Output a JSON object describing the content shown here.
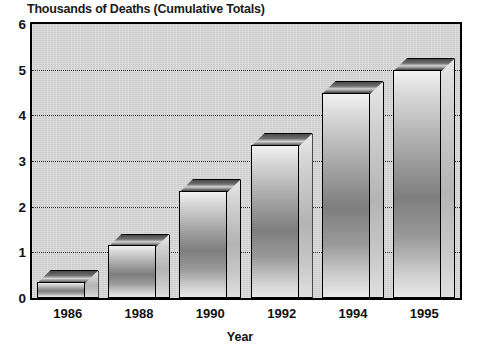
{
  "chart_data": {
    "type": "bar",
    "title": "Thousands of Deaths (Cumulative Totals)",
    "xlabel": "Year",
    "ylabel": "",
    "categories": [
      "1986",
      "1988",
      "1990",
      "1992",
      "1994",
      "1995"
    ],
    "values": [
      0.35,
      1.15,
      2.35,
      3.35,
      4.5,
      5.0
    ],
    "ylim": [
      0,
      6
    ],
    "ytick_labels": [
      "0",
      "1",
      "2",
      "3",
      "4",
      "5",
      "6"
    ],
    "ytick_values": [
      0,
      1,
      2,
      3,
      4,
      5,
      6
    ],
    "gridlines": [
      1,
      2,
      3,
      4,
      5
    ],
    "grid": true,
    "grid_style": "dotted",
    "legend": null,
    "bar_style": "3d-shaded",
    "colors": {
      "plot_background": "#d6d6d6",
      "page_background": "#ffffff",
      "axis": "#000000",
      "grid": "#2b2b2b",
      "bar_front_light": "#f2f2f2",
      "bar_front_dark": "#7e7e7e",
      "bar_top": "#4a4a4a",
      "text": "#111111"
    }
  }
}
